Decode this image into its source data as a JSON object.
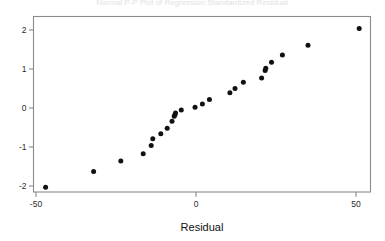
{
  "figure": {
    "background_color": "#ffffff",
    "frame_color": "#8b8b8b",
    "point_color": "#111111",
    "title_clipped": "Normal P-P Plot of Regression Standardized Residual"
  },
  "chart_data": {
    "type": "scatter",
    "title": "",
    "subtitle": "",
    "xlabel": "Residual",
    "ylabel": "",
    "xlim": [
      -53,
      56
    ],
    "ylim": [
      -2.25,
      2.25
    ],
    "grid": false,
    "legend": null,
    "xticks": [
      -50,
      0,
      50
    ],
    "xtick_labels": [
      "-50",
      "0",
      "50"
    ],
    "yticks": [
      2,
      1,
      0,
      -1,
      -2
    ],
    "ytick_labels": [
      "2",
      "1",
      "0",
      "-1",
      "-2"
    ],
    "series": [
      {
        "name": "Residual normal quantiles",
        "marker": "circle",
        "color": "#111111",
        "points": [
          {
            "x": -47.0,
            "y": -2.03
          },
          {
            "x": -32.0,
            "y": -1.63
          },
          {
            "x": -23.5,
            "y": -1.36
          },
          {
            "x": -16.5,
            "y": -1.17
          },
          {
            "x": -14.0,
            "y": -0.96
          },
          {
            "x": -13.5,
            "y": -0.79
          },
          {
            "x": -11.0,
            "y": -0.66
          },
          {
            "x": -9.0,
            "y": -0.52
          },
          {
            "x": -7.5,
            "y": -0.34
          },
          {
            "x": -6.8,
            "y": -0.21
          },
          {
            "x": -6.6,
            "y": -0.17
          },
          {
            "x": -6.4,
            "y": -0.13
          },
          {
            "x": -4.6,
            "y": -0.05
          },
          {
            "x": -0.3,
            "y": 0.02
          },
          {
            "x": 2.0,
            "y": 0.1
          },
          {
            "x": 4.2,
            "y": 0.22
          },
          {
            "x": 10.6,
            "y": 0.39
          },
          {
            "x": 12.2,
            "y": 0.5
          },
          {
            "x": 14.8,
            "y": 0.66
          },
          {
            "x": 20.5,
            "y": 0.77
          },
          {
            "x": 21.6,
            "y": 0.96
          },
          {
            "x": 21.8,
            "y": 1.02
          },
          {
            "x": 23.6,
            "y": 1.17
          },
          {
            "x": 27.0,
            "y": 1.36
          },
          {
            "x": 35.0,
            "y": 1.61
          },
          {
            "x": 51.0,
            "y": 2.04
          }
        ]
      }
    ]
  }
}
